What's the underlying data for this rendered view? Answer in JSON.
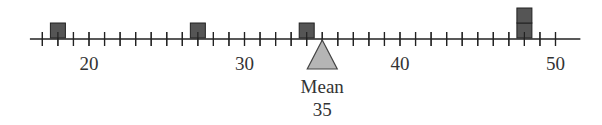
{
  "number_line": {
    "min_tick": 17,
    "max_tick": 50,
    "tick_step": 1,
    "labels": [
      {
        "value": 20,
        "text": "20"
      },
      {
        "value": 30,
        "text": "30"
      },
      {
        "value": 40,
        "text": "40"
      },
      {
        "value": 50,
        "text": "50"
      }
    ],
    "line_start_value": 16.2,
    "line_end_value": 51.6
  },
  "data_points": [
    18,
    27,
    34,
    48,
    48
  ],
  "mean": {
    "label": "Mean",
    "value": 35,
    "value_text": "35"
  },
  "colors": {
    "line": "#222222",
    "block_fill": "#555555",
    "block_stroke": "#222222",
    "triangle_fill": "#b5b5b5",
    "triangle_stroke": "#444444"
  }
}
